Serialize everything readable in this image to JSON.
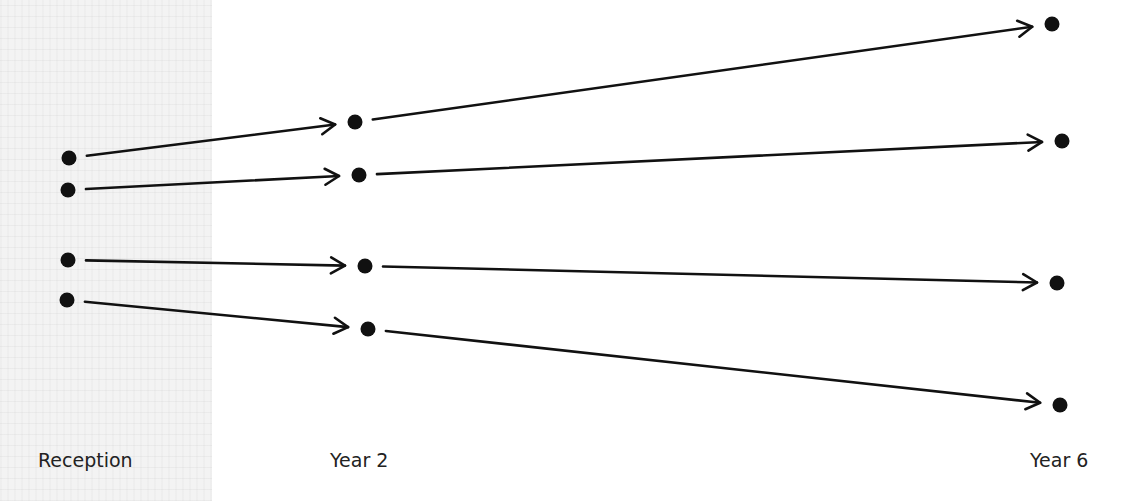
{
  "diagram": {
    "stages": [
      {
        "label": "Reception",
        "x": 38,
        "y": 449
      },
      {
        "label": "Year 2",
        "x": 330,
        "y": 449
      },
      {
        "label": "Year 6",
        "x": 1030,
        "y": 449
      }
    ],
    "tracks": [
      {
        "name": "track-1",
        "points": [
          [
            69,
            158
          ],
          [
            355,
            122
          ],
          [
            1052,
            24
          ]
        ]
      },
      {
        "name": "track-2",
        "points": [
          [
            68,
            190
          ],
          [
            359,
            175
          ],
          [
            1062,
            141
          ]
        ]
      },
      {
        "name": "track-3",
        "points": [
          [
            68,
            260
          ],
          [
            365,
            266
          ],
          [
            1057,
            283
          ]
        ]
      },
      {
        "name": "track-4",
        "points": [
          [
            67,
            300
          ],
          [
            368,
            329
          ],
          [
            1060,
            405
          ]
        ]
      }
    ],
    "colors": {
      "ink": "#111111",
      "panel": "#f3f3f3",
      "background": "#ffffff"
    }
  }
}
